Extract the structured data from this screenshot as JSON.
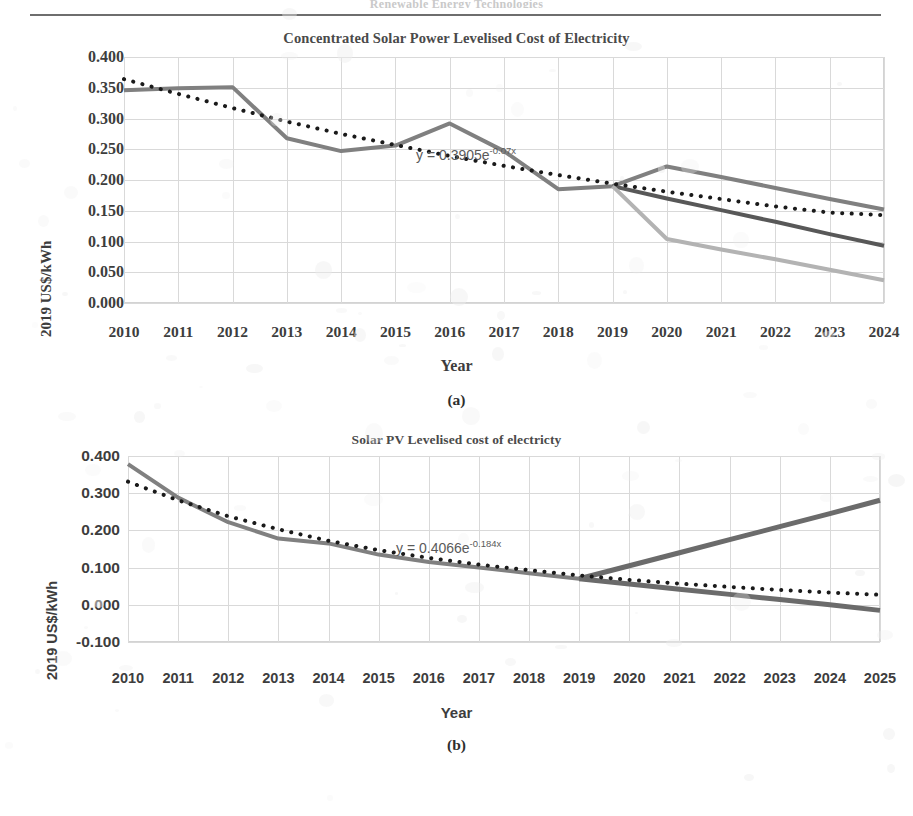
{
  "header": {
    "cut_off_text": "Renewable Energy Technologies"
  },
  "figures": [
    {
      "id": "fig-a",
      "caption": "(a)",
      "title": "Concentrated Solar Power Levelised Cost of Electricity",
      "equation": {
        "prefix": "y = 0.3905e",
        "exponent": "-0.07x"
      }
    },
    {
      "id": "fig-b",
      "caption": "(b)",
      "title": "Solar PV Levelised cost of electricty",
      "equation": {
        "prefix": "y = 0.4066e",
        "exponent": "-0.184x"
      }
    }
  ],
  "chart_data": [
    {
      "type": "line",
      "title": "Concentrated Solar Power Levelised Cost of Electricity",
      "xlabel": "Year",
      "ylabel": "2019 US$/kWh",
      "xlim": [
        2010,
        2024
      ],
      "ylim": [
        0.0,
        0.4
      ],
      "ytick_values": [
        0.4,
        0.35,
        0.3,
        0.25,
        0.2,
        0.15,
        0.1,
        0.05,
        0.0
      ],
      "ytick_labels": [
        "0.400",
        "0.350",
        "0.300",
        "0.250",
        "0.200",
        "0.150",
        "0.100",
        "0.050",
        "0.000"
      ],
      "categories": [
        2010,
        2011,
        2012,
        2013,
        2014,
        2015,
        2016,
        2017,
        2018,
        2019,
        2020,
        2021,
        2022,
        2023,
        2024
      ],
      "grid": true,
      "legend": "none",
      "annotation": "y = 0.3905e-0.07x",
      "series": [
        {
          "name": "historical-and-high-projection",
          "style": "solid",
          "color": "#808080",
          "width": 4,
          "x": [
            2010,
            2011,
            2012,
            2013,
            2014,
            2015,
            2016,
            2017,
            2018,
            2019,
            2020,
            2021,
            2022,
            2023,
            2024
          ],
          "values": [
            0.346,
            0.349,
            0.351,
            0.268,
            0.247,
            0.256,
            0.292,
            0.247,
            0.185,
            0.19,
            0.222,
            0.205,
            0.187,
            0.169,
            0.152
          ]
        },
        {
          "name": "mid-projection",
          "style": "solid",
          "color": "#585858",
          "width": 4,
          "x": [
            2019,
            2020,
            2021,
            2022,
            2023,
            2024
          ],
          "values": [
            0.19,
            0.17,
            0.151,
            0.132,
            0.112,
            0.093
          ]
        },
        {
          "name": "low-projection",
          "style": "solid",
          "color": "#b3b3b3",
          "width": 4,
          "x": [
            2019,
            2020,
            2021,
            2022,
            2023,
            2024
          ],
          "values": [
            0.19,
            0.104,
            0.087,
            0.071,
            0.054,
            0.037
          ]
        },
        {
          "name": "exponential-trendline",
          "style": "dotted",
          "color": "#1a1a1a",
          "width": 4,
          "x": [
            2010,
            2011,
            2012,
            2013,
            2014,
            2015,
            2016,
            2017,
            2018,
            2019,
            2020,
            2021,
            2022,
            2023,
            2024
          ],
          "values": [
            0.364,
            0.34,
            0.317,
            0.295,
            0.275,
            0.257,
            0.239,
            0.223,
            0.208,
            0.194,
            0.181,
            0.169,
            0.157,
            0.147,
            0.143
          ]
        }
      ]
    },
    {
      "type": "line",
      "title": "Solar PV Levelised cost of electricty",
      "xlabel": "Year",
      "ylabel": "2019 US$/kWh",
      "xlim": [
        2010,
        2025
      ],
      "ylim": [
        -0.1,
        0.4
      ],
      "ytick_values": [
        0.4,
        0.3,
        0.2,
        0.1,
        0.0,
        -0.1
      ],
      "ytick_labels": [
        "0.400",
        "0.300",
        "0.200",
        "0.100",
        "0.000",
        "-0.100"
      ],
      "categories": [
        2010,
        2011,
        2012,
        2013,
        2014,
        2015,
        2016,
        2017,
        2018,
        2019,
        2020,
        2021,
        2022,
        2023,
        2024,
        2025
      ],
      "grid": true,
      "legend": "none",
      "annotation": "y = 0.4066e-0.184x",
      "series": [
        {
          "name": "historical-lcoe",
          "style": "solid",
          "color": "#808080",
          "width": 4,
          "x": [
            2010,
            2011,
            2012,
            2013,
            2014,
            2015,
            2016,
            2017,
            2018,
            2019
          ],
          "values": [
            0.378,
            0.288,
            0.222,
            0.178,
            0.165,
            0.135,
            0.115,
            0.1,
            0.085,
            0.07
          ]
        },
        {
          "name": "upper-projection",
          "style": "solid",
          "color": "#6b6b6b",
          "width": 5,
          "x": [
            2019,
            2020,
            2021,
            2022,
            2023,
            2024,
            2025
          ],
          "values": [
            0.07,
            0.105,
            0.14,
            0.175,
            0.21,
            0.245,
            0.281
          ]
        },
        {
          "name": "lower-projection",
          "style": "solid",
          "color": "#6b6b6b",
          "width": 5,
          "x": [
            2019,
            2020,
            2021,
            2022,
            2023,
            2024,
            2025
          ],
          "values": [
            0.07,
            0.056,
            0.042,
            0.028,
            0.014,
            0.0,
            -0.015
          ]
        },
        {
          "name": "exponential-trendline",
          "style": "dotted",
          "color": "#1a1a1a",
          "width": 4,
          "x": [
            2010,
            2011,
            2012,
            2013,
            2014,
            2015,
            2016,
            2017,
            2018,
            2019,
            2020,
            2021,
            2022,
            2023,
            2024,
            2025
          ],
          "values": [
            0.331,
            0.281,
            0.238,
            0.203,
            0.172,
            0.147,
            0.126,
            0.108,
            0.093,
            0.079,
            0.067,
            0.057,
            0.048,
            0.04,
            0.033,
            0.027
          ]
        }
      ]
    }
  ]
}
